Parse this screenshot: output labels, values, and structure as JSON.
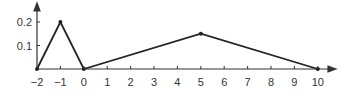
{
  "chart_data": {
    "type": "line",
    "title": "",
    "xlabel": "",
    "ylabel": "",
    "x": [
      -2,
      -1,
      0,
      5,
      10
    ],
    "values": [
      0,
      0.2,
      0,
      0.15,
      0
    ],
    "xticks": [
      "−2",
      "−1",
      "0",
      "1",
      "2",
      "3",
      "4",
      "5",
      "6",
      "7",
      "8",
      "9",
      "10"
    ],
    "yticks": [
      "0.1",
      "0.2"
    ],
    "xlim": [
      -2,
      10.5
    ],
    "ylim": [
      0,
      0.25
    ],
    "grid": false,
    "legend": null
  }
}
